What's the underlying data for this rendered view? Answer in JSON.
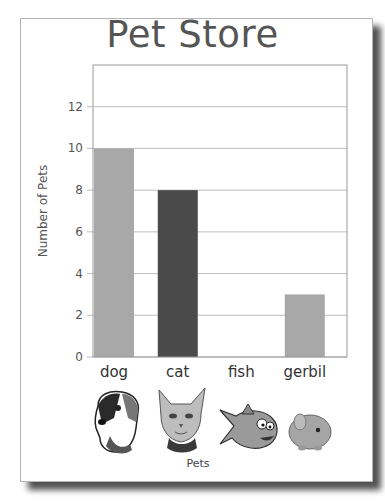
{
  "chart_data": {
    "type": "bar",
    "title": "Pet Store",
    "xlabel": "Pets",
    "ylabel": "Number of Pets",
    "categories": [
      "dog",
      "cat",
      "fish",
      "gerbil"
    ],
    "values": [
      10,
      8,
      0,
      3
    ],
    "bar_colors": [
      "#a8a8a8",
      "#4a4a4a",
      "#a8a8a8",
      "#a8a8a8"
    ],
    "ylim": [
      0,
      14
    ],
    "yticks": [
      0,
      2,
      4,
      6,
      8,
      10,
      12
    ],
    "grid": true,
    "legend": "none",
    "category_icons": [
      "dog-face-icon",
      "cat-face-icon",
      "fish-icon",
      "gerbil-icon"
    ]
  }
}
